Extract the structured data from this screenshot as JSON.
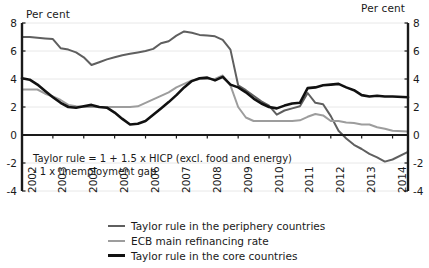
{
  "chart_data": {
    "type": "line",
    "title": "",
    "xlabel": "",
    "ylabel": "Per cent",
    "ylabel_right": "Per cent",
    "ylim": [
      -4,
      8
    ],
    "xlim": [
      2002,
      2014.5
    ],
    "yticks": [
      8,
      6,
      4,
      2,
      0,
      -2,
      -4
    ],
    "ytick_labels": [
      "8",
      "6",
      "4",
      "2",
      "0",
      "-2",
      "-4"
    ],
    "ytick_labels_right": [
      "8",
      "6",
      "4",
      "2",
      "0",
      "-2",
      "-4"
    ],
    "xticks": [
      2002,
      2003,
      2004,
      2005,
      2006,
      2007,
      2008,
      2009,
      2010,
      2011,
      2012,
      2013,
      2014
    ],
    "xtick_labels": [
      "2002",
      "2003",
      "2004",
      "2005",
      "2006",
      "2007",
      "2008",
      "2009",
      "2010",
      "2011",
      "2012",
      "2013",
      "2014"
    ],
    "grid": true,
    "grid_axis": "y",
    "zero_line": true,
    "legend_position": "below",
    "annotation": "Taylor rule = 1 + 1.5 x HICP (excl. food and energy)\n - 1 x unemployment gap",
    "series": [
      {
        "name": "Taylor rule in the periphery countries",
        "color": "#5f5f5f",
        "width": 2.0,
        "x": [
          2002.0,
          2002.25,
          2002.5,
          2002.75,
          2003.0,
          2003.25,
          2003.5,
          2003.75,
          2004.0,
          2004.25,
          2004.5,
          2004.75,
          2005.0,
          2005.25,
          2005.5,
          2005.75,
          2006.0,
          2006.25,
          2006.5,
          2006.75,
          2007.0,
          2007.25,
          2007.5,
          2007.75,
          2008.0,
          2008.25,
          2008.5,
          2008.75,
          2009.0,
          2009.25,
          2009.5,
          2009.75,
          2010.0,
          2010.25,
          2010.5,
          2010.75,
          2011.0,
          2011.25,
          2011.5,
          2011.75,
          2012.0,
          2012.25,
          2012.5,
          2012.75,
          2013.0,
          2013.25,
          2013.5,
          2013.75,
          2014.0,
          2014.5
        ],
        "y": [
          7.0,
          7.0,
          6.95,
          6.9,
          6.85,
          6.2,
          6.1,
          5.9,
          5.55,
          5.0,
          5.2,
          5.4,
          5.55,
          5.7,
          5.8,
          5.9,
          6.0,
          6.15,
          6.55,
          6.7,
          7.1,
          7.4,
          7.3,
          7.15,
          7.1,
          7.05,
          6.8,
          6.1,
          3.55,
          3.2,
          2.8,
          2.4,
          2.1,
          1.45,
          1.75,
          1.9,
          2.05,
          3.0,
          2.3,
          2.2,
          1.35,
          0.3,
          -0.25,
          -0.7,
          -1.0,
          -1.35,
          -1.6,
          -1.9,
          -1.75,
          -1.2
        ]
      },
      {
        "name": "ECB main refinancing rate",
        "color": "#9d9d9d",
        "width": 2.0,
        "x": [
          2002.0,
          2002.25,
          2002.5,
          2002.75,
          2003.0,
          2003.25,
          2003.5,
          2003.75,
          2004.0,
          2004.25,
          2004.5,
          2004.75,
          2005.0,
          2005.25,
          2005.5,
          2005.75,
          2006.0,
          2006.25,
          2006.5,
          2006.75,
          2007.0,
          2007.25,
          2007.5,
          2007.75,
          2008.0,
          2008.25,
          2008.5,
          2008.75,
          2009.0,
          2009.25,
          2009.5,
          2009.75,
          2010.0,
          2010.25,
          2010.5,
          2010.75,
          2011.0,
          2011.25,
          2011.5,
          2011.75,
          2012.0,
          2012.25,
          2012.5,
          2012.75,
          2013.0,
          2013.25,
          2013.5,
          2013.75,
          2014.0,
          2014.5
        ],
        "y": [
          3.25,
          3.25,
          3.25,
          2.95,
          2.75,
          2.5,
          2.15,
          2.05,
          2.0,
          2.0,
          2.0,
          2.0,
          2.0,
          2.0,
          2.0,
          2.05,
          2.3,
          2.55,
          2.8,
          3.05,
          3.4,
          3.65,
          3.9,
          4.0,
          4.0,
          4.0,
          4.25,
          3.55,
          2.0,
          1.25,
          1.0,
          1.0,
          1.0,
          1.0,
          1.0,
          1.0,
          1.05,
          1.3,
          1.5,
          1.4,
          1.0,
          1.0,
          0.9,
          0.85,
          0.75,
          0.75,
          0.55,
          0.45,
          0.3,
          0.25
        ]
      },
      {
        "name": "Taylor rule in the core countries",
        "color": "#111111",
        "width": 2.6,
        "x": [
          2002.0,
          2002.25,
          2002.5,
          2002.75,
          2003.0,
          2003.25,
          2003.5,
          2003.75,
          2004.0,
          2004.25,
          2004.5,
          2004.75,
          2005.0,
          2005.25,
          2005.5,
          2005.75,
          2006.0,
          2006.25,
          2006.5,
          2006.75,
          2007.0,
          2007.25,
          2007.5,
          2007.75,
          2008.0,
          2008.25,
          2008.5,
          2008.75,
          2009.0,
          2009.25,
          2009.5,
          2009.75,
          2010.0,
          2010.25,
          2010.5,
          2010.75,
          2011.0,
          2011.25,
          2011.5,
          2011.75,
          2012.0,
          2012.25,
          2012.5,
          2012.75,
          2013.0,
          2013.25,
          2013.5,
          2013.75,
          2014.0,
          2014.5
        ],
        "y": [
          4.05,
          3.95,
          3.6,
          3.15,
          2.7,
          2.3,
          2.0,
          1.95,
          2.05,
          2.15,
          2.0,
          1.95,
          1.6,
          1.15,
          0.75,
          0.8,
          1.0,
          1.45,
          1.9,
          2.35,
          2.85,
          3.4,
          3.85,
          4.05,
          4.1,
          3.9,
          4.15,
          3.6,
          3.4,
          3.05,
          2.6,
          2.25,
          2.0,
          1.9,
          2.1,
          2.25,
          2.3,
          3.35,
          3.4,
          3.55,
          3.6,
          3.65,
          3.4,
          3.2,
          2.85,
          2.75,
          2.8,
          2.75,
          2.75,
          2.7
        ]
      }
    ]
  }
}
